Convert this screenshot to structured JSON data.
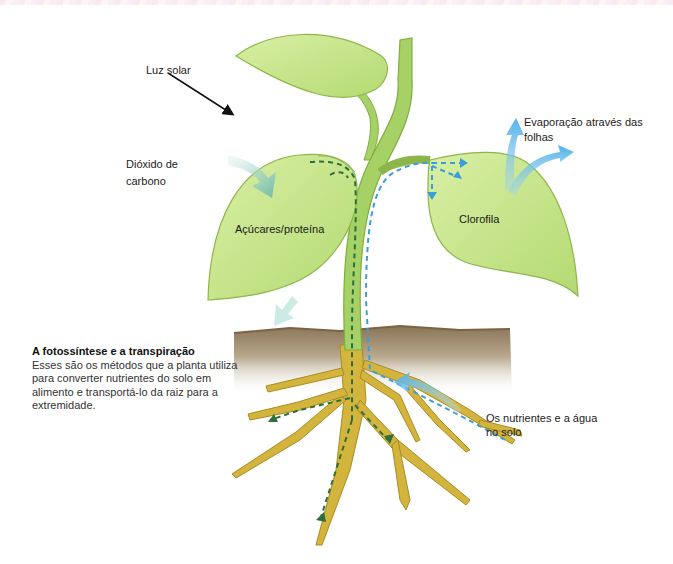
{
  "diagram": {
    "title": "A fotossíntese e a transpiração",
    "description": "Esses são os métodos que a planta utiliza para converter nutrientes do solo em alimento e transportá-lo da raiz para a extremidade.",
    "labels": {
      "sunlight": "Luz solar",
      "co2_line1": "Dióxido de",
      "co2_line2": "carbono",
      "evaporation_line1": "Evaporação através das",
      "evaporation_line2": "folhas",
      "sugars": "Açúcares/proteína",
      "chlorophyll": "Clorofila",
      "nutrients_line1": "Os nutrientes e a água",
      "nutrients_line2": "no solo"
    },
    "colors": {
      "leaf": "#c9e58a",
      "leaf_dark": "#9cc85a",
      "leaf_outline": "#8db64a",
      "stem": "#a8d46a",
      "root": "#d4b43a",
      "root_outline": "#b08f24",
      "soil": "#8f7a5c",
      "water_arrow": "#5ab4e8",
      "co2_arrow": "#7ec4b4",
      "sugar_flow": "#2e6e3a"
    }
  }
}
